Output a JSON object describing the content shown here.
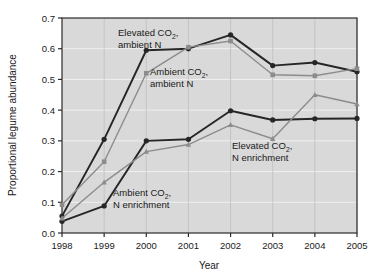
{
  "chart_data": {
    "type": "line",
    "title": "",
    "xlabel": "Year",
    "ylabel": "Proportional legume abundance",
    "x": [
      1998,
      1999,
      2000,
      2001,
      2002,
      2003,
      2004,
      2005
    ],
    "xtick_labels": [
      "1998",
      "1999",
      "2000",
      "2001",
      "2002",
      "2003",
      "2004",
      "2005"
    ],
    "ytick_labels": [
      "0.0",
      "0.1",
      "0.2",
      "0.3",
      "0.4",
      "0.5",
      "0.6",
      "0.7"
    ],
    "ytick_values": [
      0.0,
      0.1,
      0.2,
      0.3,
      0.4,
      0.5,
      0.6,
      0.7
    ],
    "xlim": [
      1998,
      2005
    ],
    "ylim": [
      0.0,
      0.7
    ],
    "grid": true,
    "legend_position": "inline-annotations",
    "plot_background": "#d9d9d9",
    "series": [
      {
        "name": "Elevated CO2, ambient N",
        "color": "#262626",
        "marker": "circle",
        "values": [
          0.055,
          0.305,
          0.595,
          0.6,
          0.645,
          0.545,
          0.555,
          0.525
        ]
      },
      {
        "name": "Ambient CO2, ambient N",
        "color": "#8c8c8c",
        "marker": "square",
        "values": [
          0.092,
          0.232,
          0.52,
          0.605,
          0.625,
          0.515,
          0.512,
          0.535
        ]
      },
      {
        "name": "Ambient CO2, N enrichment",
        "color": "#262626",
        "marker": "circle",
        "values": [
          0.038,
          0.088,
          0.3,
          0.305,
          0.398,
          0.368,
          0.372,
          0.373
        ]
      },
      {
        "name": "Elevated CO2, N enrichment",
        "color": "#8c8c8c",
        "marker": "triangle",
        "values": [
          0.048,
          0.165,
          0.265,
          0.288,
          0.352,
          0.307,
          0.45,
          0.42
        ]
      }
    ],
    "annotations": [
      {
        "id": "elevated-co2-ambient-n",
        "line1": "Elevated CO",
        "sub": "2",
        "tail": ",",
        "line2": "ambient N"
      },
      {
        "id": "ambient-co2-ambient-n",
        "line1": "Ambient CO",
        "sub": "2",
        "tail": ",",
        "line2": "ambient N"
      },
      {
        "id": "ambient-co2-n-enrichment",
        "line1": "Ambient CO",
        "sub": "2",
        "tail": ",",
        "line2": "N enrichment"
      },
      {
        "id": "elevated-co2-n-enrichment",
        "line1": "Elevated CO",
        "sub": "2",
        "tail": ",",
        "line2": "N enrichment"
      }
    ]
  }
}
